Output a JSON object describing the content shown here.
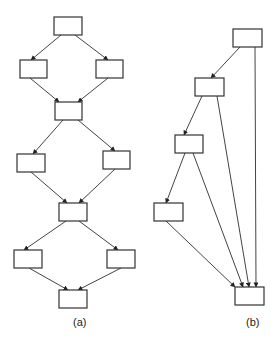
{
  "diagrams": [
    {
      "id": "a",
      "caption": "(a)",
      "caption_pos": [
        73,
        326
      ],
      "nodes": [
        {
          "x": 54,
          "y": 17,
          "w": 28,
          "h": 18
        },
        {
          "x": 20,
          "y": 60,
          "w": 27,
          "h": 18
        },
        {
          "x": 96,
          "y": 60,
          "w": 27,
          "h": 18
        },
        {
          "x": 55,
          "y": 102,
          "w": 27,
          "h": 18
        },
        {
          "x": 17,
          "y": 154,
          "w": 28,
          "h": 18
        },
        {
          "x": 103,
          "y": 151,
          "w": 27,
          "h": 18
        },
        {
          "x": 59,
          "y": 203,
          "w": 28,
          "h": 18
        },
        {
          "x": 14,
          "y": 250,
          "w": 28,
          "h": 18
        },
        {
          "x": 107,
          "y": 250,
          "w": 28,
          "h": 18
        },
        {
          "x": 59,
          "y": 290,
          "w": 28,
          "h": 18
        }
      ],
      "edges": [
        [
          61,
          35,
          31,
          60
        ],
        [
          75,
          35,
          108,
          60
        ],
        [
          30,
          78,
          59,
          102
        ],
        [
          108,
          78,
          78,
          102
        ],
        [
          63,
          120,
          33,
          154
        ],
        [
          78,
          120,
          115,
          151
        ],
        [
          31,
          172,
          67,
          203
        ],
        [
          115,
          169,
          79,
          203
        ],
        [
          66,
          221,
          24,
          250
        ],
        [
          79,
          221,
          118,
          250
        ],
        [
          29,
          268,
          68,
          290
        ],
        [
          121,
          268,
          78,
          290
        ]
      ]
    },
    {
      "id": "b",
      "caption": "(b)",
      "caption_pos": [
        246,
        326
      ],
      "nodes": [
        {
          "x": 233,
          "y": 29,
          "w": 29,
          "h": 18
        },
        {
          "x": 195,
          "y": 78,
          "w": 29,
          "h": 18
        },
        {
          "x": 175,
          "y": 135,
          "w": 28,
          "h": 18
        },
        {
          "x": 154,
          "y": 203,
          "w": 29,
          "h": 18
        },
        {
          "x": 235,
          "y": 287,
          "w": 29,
          "h": 18
        }
      ],
      "edges": [
        [
          240,
          47,
          211,
          78
        ],
        [
          255,
          47,
          256,
          287
        ],
        [
          202,
          96,
          184,
          135
        ],
        [
          217,
          96,
          249,
          287
        ],
        [
          185,
          153,
          166,
          203
        ],
        [
          193,
          153,
          243,
          287
        ],
        [
          166,
          221,
          235,
          287
        ]
      ]
    }
  ],
  "colors": {
    "stroke": "#333333",
    "edge": "#444444",
    "background": "#ffffff"
  }
}
